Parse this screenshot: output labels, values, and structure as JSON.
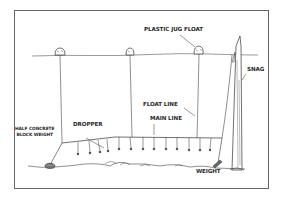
{
  "diagram": {
    "type": "trotline fishing rig illustration",
    "labels": {
      "plastic_jug_float": "PLASTIC JUG FLOAT",
      "snag": "SNAG",
      "float_line": "FLOAT LINE",
      "main_line": "MAIN LINE",
      "dropper": "DROPPER",
      "half_concrete_block_weight_line1": "HALF CONCRETE",
      "half_concrete_block_weight_line2": "BLOCK WEIGHT",
      "weight": "WEIGHT"
    },
    "components": {
      "floats": [
        {
          "name": "float-1",
          "x": 60,
          "y": 52
        },
        {
          "name": "float-2",
          "x": 130,
          "y": 52
        },
        {
          "name": "float-3",
          "x": 198,
          "y": 49
        }
      ],
      "dropper_count": 13
    },
    "colors": {
      "ink": "#2a2a2a",
      "frame": "#555555",
      "background": "#ffffff"
    }
  }
}
